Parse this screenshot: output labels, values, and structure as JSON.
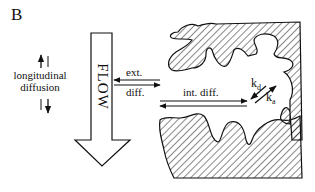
{
  "figure": {
    "panel_label": "B",
    "flow_label": "FLOW",
    "longitudinal_line1": "longitudinal",
    "longitudinal_line2": "diffusion",
    "ext_label": "ext.",
    "diff_label": "diff.",
    "int_diff_label": "int. diff.",
    "kd_base": "k",
    "kd_sub": "d",
    "ka_base": "k",
    "ka_sub": "a"
  },
  "colors": {
    "ink": "#111111",
    "background": "#ffffff"
  }
}
